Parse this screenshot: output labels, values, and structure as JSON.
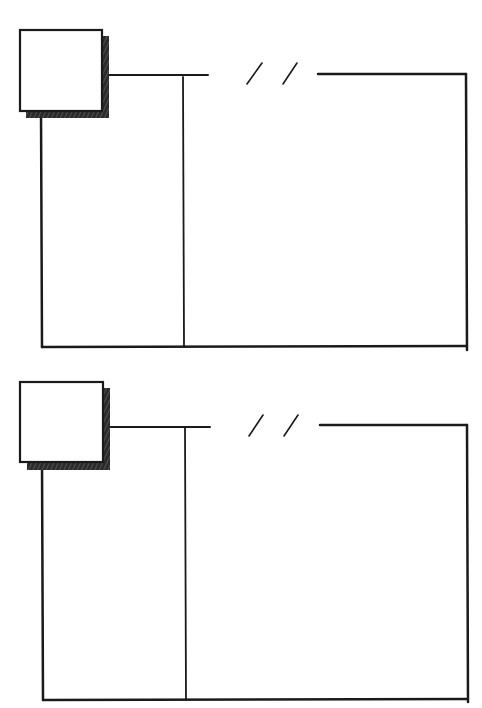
{
  "diagram": {
    "stroke_color": "#1a1a1a",
    "shadow_color": "#2b2b2b",
    "background": "#ffffff",
    "panels": [
      {
        "id": "panel-1",
        "thumbnail": {
          "x": 20,
          "y": 30,
          "w": 82,
          "h": 81
        },
        "top_line_left": {
          "x1": 106,
          "x2": 208,
          "y": 75
        },
        "break_marker": "/ /",
        "top_line_right": {
          "x1": 318,
          "x2": 466,
          "y": 74
        },
        "left_edge_x": 41,
        "divider_x": 183,
        "right_edge_x": 466,
        "bottom_y": 347
      },
      {
        "id": "panel-2",
        "thumbnail": {
          "x": 20,
          "y": 382,
          "w": 83,
          "h": 80
        },
        "top_line_left": {
          "x1": 108,
          "x2": 210,
          "y": 427
        },
        "break_marker": "/ /",
        "top_line_right": {
          "x1": 320,
          "x2": 467,
          "y": 425
        },
        "left_edge_x": 42,
        "divider_x": 185,
        "right_edge_x": 467,
        "bottom_y": 700
      }
    ]
  }
}
